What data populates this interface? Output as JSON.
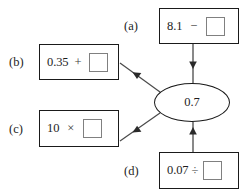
{
  "diagram": {
    "type": "expression-web",
    "center": {
      "label": "result-value",
      "value": "0.7",
      "shape": "ellipse"
    },
    "boxes": [
      {
        "id": "a",
        "label": "(a)",
        "operand": "8.1",
        "operator": "−",
        "operator_name": "minus",
        "answer": "",
        "answer_placeholder": "empty-square",
        "position": "top-right"
      },
      {
        "id": "b",
        "label": "(b)",
        "operand": "0.35",
        "operator": "+",
        "operator_name": "plus",
        "answer": "",
        "answer_placeholder": "empty-square",
        "position": "upper-left"
      },
      {
        "id": "c",
        "label": "(c)",
        "operand": "10",
        "operator": "×",
        "operator_name": "multiply",
        "answer": "",
        "answer_placeholder": "empty-square",
        "position": "lower-left"
      },
      {
        "id": "d",
        "label": "(d)",
        "operand": "0.07",
        "operator": "÷",
        "operator_name": "divide",
        "answer": "",
        "answer_placeholder": "empty-square",
        "position": "bottom-right"
      }
    ],
    "edges": [
      {
        "from": "a",
        "to": "center",
        "direction": "down",
        "arrowhead": "at-center"
      },
      {
        "from": "center",
        "to": "b",
        "direction": "up-left",
        "arrowhead": "toward-box"
      },
      {
        "from": "center",
        "to": "c",
        "direction": "up-left",
        "arrowhead": "toward-box"
      },
      {
        "from": "d",
        "to": "center",
        "direction": "up",
        "arrowhead": "at-center"
      }
    ],
    "colors": {
      "stroke": "#1a1a1a",
      "edge": "#4a4a4a",
      "slot_border": "#808080",
      "background": "#ffffff",
      "text": "#1d1d1d"
    }
  }
}
